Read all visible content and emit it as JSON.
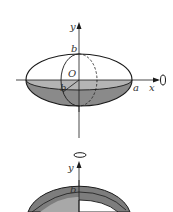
{
  "figure_top": {
    "description": "Ellipse rotated about the x-axis forming an ellipsoid",
    "labels": {
      "y_axis": "y",
      "x_axis": "x",
      "origin": "O",
      "semi_minor_top": "b",
      "semi_minor_radius": "b",
      "semi_major": "a"
    },
    "rotation_axis": "x"
  },
  "figure_bottom": {
    "description": "Ellipse rotated about the y-axis (partial view, cut off)",
    "labels": {
      "y_axis": "y",
      "semi_minor": "b"
    },
    "rotation_axis": "y"
  },
  "colors": {
    "stroke": "#1a1a1a",
    "shade_light": "#b0b0b0",
    "shade_dark": "#7d7d7d",
    "background": "#ffffff"
  }
}
